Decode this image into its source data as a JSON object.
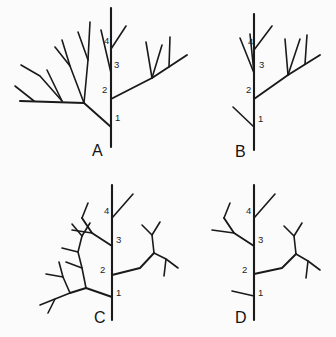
{
  "figure": {
    "background_color": "#fcfbfc",
    "line_color": "#1a1a1a",
    "panels": [
      {
        "id": "A",
        "label": "A",
        "label_x": 92,
        "label_y": 156,
        "stem": {
          "x": 111,
          "y_top": 8,
          "y_bottom": 147
        },
        "node_labels": [
          {
            "text": "1",
            "x": 115,
            "y": 121
          },
          {
            "text": "2",
            "x": 102,
            "y": 93
          },
          {
            "text": "3",
            "x": 114,
            "y": 68
          },
          {
            "text": "4",
            "x": 104,
            "y": 44
          }
        ]
      },
      {
        "id": "B",
        "label": "B",
        "label_x": 235,
        "label_y": 157,
        "stem": {
          "x": 254,
          "y_top": 14,
          "y_bottom": 150
        },
        "node_labels": [
          {
            "text": "1",
            "x": 258,
            "y": 122
          },
          {
            "text": "2",
            "x": 246,
            "y": 93
          },
          {
            "text": "3",
            "x": 259,
            "y": 68
          },
          {
            "text": "4",
            "x": 248,
            "y": 45
          }
        ]
      },
      {
        "id": "C",
        "label": "C",
        "label_x": 94,
        "label_y": 323,
        "stem": {
          "x": 112,
          "y_top": 185,
          "y_bottom": 320
        },
        "node_labels": [
          {
            "text": "1",
            "x": 116,
            "y": 296
          },
          {
            "text": "2",
            "x": 100,
            "y": 273
          },
          {
            "text": "3",
            "x": 116,
            "y": 243
          },
          {
            "text": "4",
            "x": 104,
            "y": 214
          }
        ]
      },
      {
        "id": "D",
        "label": "D",
        "label_x": 235,
        "label_y": 323,
        "stem": {
          "x": 254,
          "y_top": 185,
          "y_bottom": 320
        },
        "node_labels": [
          {
            "text": "1",
            "x": 258,
            "y": 296
          },
          {
            "text": "2",
            "x": 242,
            "y": 273
          },
          {
            "text": "3",
            "x": 258,
            "y": 243
          },
          {
            "text": "4",
            "x": 246,
            "y": 214
          }
        ]
      }
    ],
    "node_numbers": [
      "1",
      "2",
      "3",
      "4"
    ],
    "panel_letters": [
      "A",
      "B",
      "C",
      "D"
    ]
  }
}
